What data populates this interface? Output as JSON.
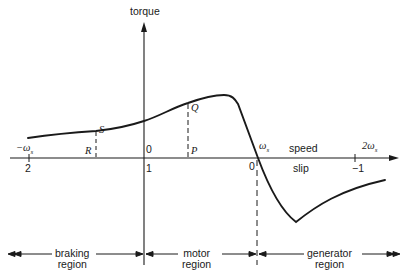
{
  "diagram": {
    "axes": {
      "vertical_label": "torque",
      "horizontal_speed_label": "speed",
      "horizontal_slip_label": "slip"
    },
    "speed_ticks": [
      {
        "id": "neg_ws",
        "label": "−ωs",
        "main": "−ω",
        "sub": "s"
      },
      {
        "id": "zero",
        "label": "0"
      },
      {
        "id": "ws",
        "label": "ωs",
        "main": "ω",
        "sub": "s"
      },
      {
        "id": "two_ws",
        "label": "2ωs",
        "main": "2ω",
        "sub": "s"
      }
    ],
    "slip_ticks": [
      {
        "id": "s2",
        "label": "2"
      },
      {
        "id": "s1",
        "label": "1"
      },
      {
        "id": "s0",
        "label": "0"
      },
      {
        "id": "sm1",
        "label": "−1"
      }
    ],
    "points": {
      "S": "S",
      "R": "R",
      "Q": "Q",
      "P": "P"
    },
    "regions": [
      {
        "id": "braking",
        "line1": "braking",
        "line2": "region"
      },
      {
        "id": "motor",
        "line1": "motor",
        "line2": "region"
      },
      {
        "id": "generator",
        "line1": "generator",
        "line2": "region"
      }
    ],
    "colors": {
      "line": "#1a1a1a",
      "background": "#ffffff"
    }
  }
}
